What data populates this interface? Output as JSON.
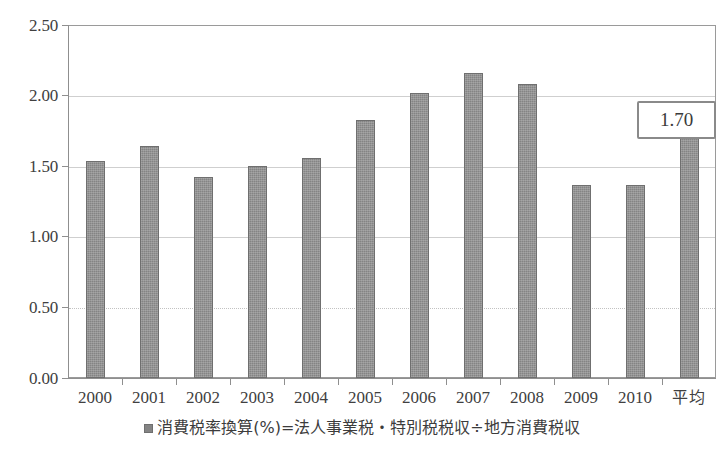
{
  "chart_data": {
    "type": "bar",
    "title": "",
    "xlabel": "",
    "ylabel": "",
    "categories": [
      "2000",
      "2001",
      "2002",
      "2003",
      "2004",
      "2005",
      "2006",
      "2007",
      "2008",
      "2009",
      "2010",
      "平均"
    ],
    "values": [
      1.54,
      1.64,
      1.42,
      1.5,
      1.56,
      1.83,
      2.02,
      2.16,
      2.08,
      1.37,
      1.37,
      1.7
    ],
    "series": [
      {
        "name": "消費税率換算(%)=法人事業税・特別税税収÷地方消費税収",
        "values": [
          1.54,
          1.64,
          1.42,
          1.5,
          1.56,
          1.83,
          2.02,
          2.16,
          2.08,
          1.37,
          1.37,
          1.7
        ]
      }
    ],
    "ylim": [
      0.0,
      2.5
    ],
    "ytick_values": [
      0.0,
      0.5,
      1.0,
      1.5,
      2.0,
      2.5
    ],
    "ytick_labels": [
      "0.00",
      "0.50",
      "1.00",
      "1.50",
      "2.00",
      "2.50"
    ],
    "grid": true,
    "legend_position": "bottom",
    "bar_color": "#848484",
    "annotations": [
      {
        "name": "average-callout",
        "text": "1.70",
        "target_category": "平均"
      }
    ]
  },
  "legend": {
    "marker": "square-marker",
    "label": "消費税率換算(%)=法人事業税・特別税税収÷地方消費税収"
  },
  "callout": {
    "value": "1.70"
  },
  "colors": {
    "bar": "#848484",
    "bar_border": "#6f6f6f",
    "grid": "#cfcfcf",
    "axis": "#8f8f8f",
    "text": "#3a3a3a",
    "background": "#ffffff"
  }
}
